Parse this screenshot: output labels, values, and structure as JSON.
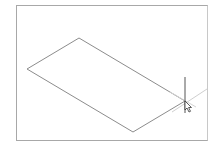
{
  "canvas": {
    "background": "#ffffff",
    "frame_color": "#a8a8a8",
    "line_color": "#8a8a8a",
    "guide_color": "#d0d0d0"
  },
  "shape": {
    "type": "parallelogram",
    "vertices": [
      [
        27,
        69
      ],
      [
        79,
        38
      ],
      [
        185,
        101
      ],
      [
        133,
        132
      ]
    ]
  },
  "crosshair": {
    "x": 185,
    "y": 101,
    "vertical": [
      [
        185,
        77
      ],
      [
        185,
        113
      ]
    ],
    "guide_a": [
      [
        170,
        92
      ],
      [
        196,
        107
      ]
    ],
    "guide_b": [
      [
        172,
        112
      ],
      [
        207,
        89
      ]
    ]
  },
  "cursor": {
    "icon": "arrow-cursor-icon",
    "x": 185,
    "y": 101
  }
}
